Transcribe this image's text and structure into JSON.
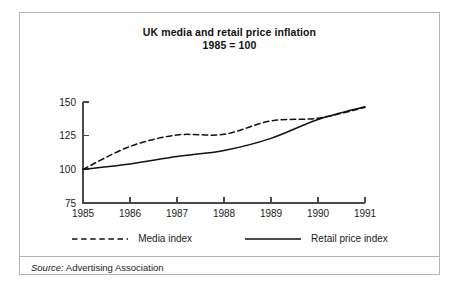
{
  "figure": {
    "title_line1": "UK media and retail price inflation",
    "title_line2": "1985 = 100",
    "source_label": "Source:",
    "source_text": " Advertising Association",
    "frame_color": "#b4b4b4",
    "line_color": "#111111"
  },
  "legend": {
    "media_label": "Media index",
    "retail_label": "Retail price index",
    "media_style": "dashed",
    "retail_style": "solid"
  },
  "chart_data": {
    "type": "line",
    "title": "UK media and retail price inflation 1985 = 100",
    "subtitle": "1985 = 100",
    "xlabel": "",
    "ylabel": "",
    "x": [
      1985,
      1986,
      1987,
      1988,
      1989,
      1990,
      1991
    ],
    "xlim": [
      1985,
      1991
    ],
    "ylim": [
      75,
      150
    ],
    "yticks": [
      75,
      100,
      125,
      150
    ],
    "xticks": [
      1985,
      1986,
      1987,
      1988,
      1989,
      1990,
      1991
    ],
    "xtick_labels": [
      "1985",
      "1986",
      "1987",
      "1988",
      "1989",
      "1990",
      "1991"
    ],
    "ytick_labels": [
      "75",
      "100",
      "125",
      "150"
    ],
    "grid": false,
    "legend_position": "below-plot",
    "series": [
      {
        "name": "Media index",
        "style": "dashed",
        "values": [
          100,
          117,
          125.5,
          126,
          136,
          138,
          146
        ]
      },
      {
        "name": "Retail price index",
        "style": "solid",
        "values": [
          100,
          104,
          109.5,
          114,
          123,
          137,
          146.5
        ]
      }
    ],
    "annotations": [
      "Series cross between 1990 and 1991",
      "Both series indexed to 100 in 1985"
    ],
    "source": "Advertising Association"
  }
}
